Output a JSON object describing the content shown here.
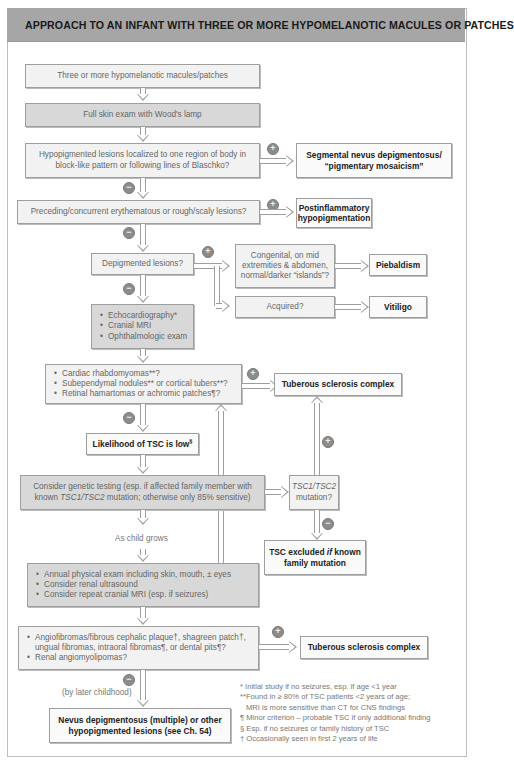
{
  "header": {
    "title": "APPROACH TO AN INFANT WITH THREE OR MORE HYPOMELANOTIC MACULES OR PATCHES"
  },
  "colors": {
    "header_bg": "#a6a6a6",
    "box_light": "#f2f2f2",
    "box_dark": "#d8d8d8",
    "border": "#9e9e9e",
    "sign_circle": "#8c8c8c"
  },
  "signs": {
    "positive": "+",
    "negative": "−"
  },
  "nodes": {
    "start": "Three or more hypomelanotic macules/patches",
    "woods_lamp": "Full skin exam with Wood's lamp",
    "segmental_q": "Hypopigmented lesions localized to one region of body in block-like pattern or following lines of Blaschko?",
    "segmental_result": "Segmental nevus depigmentosus/ “pigmentary mosaicism”",
    "postinflammatory_q": "Preceding/concurrent erythematous or rough/scaly lesions?",
    "postinflammatory_result": "Postinflammatory hypopigmentation",
    "depigmented_q": "Depigmented lesions?",
    "congenital_q": "Congenital, on mid extremities & abdomen, normal/darker “islands”?",
    "piebaldism": "Piebaldism",
    "acquired_q": "Acquired?",
    "vitiligo": "Vitiligo",
    "workup": [
      "Echocardiography*",
      "Cranial MRI",
      "Ophthalmologic exam"
    ],
    "tsc_findings_q": [
      "Cardiac rhabdomyomas**?",
      "Subependymal nodules** or cortical tubers**?",
      "Retinal hamartomas or achromic patches¶?"
    ],
    "tsc_result_1": "Tuberous sclerosis complex",
    "tsc_low": "Likelihood of TSC is low",
    "tsc_low_sup": "§",
    "genetic_testing_pre": "Consider genetic testing (esp. if affected family member with known ",
    "genetic_testing_gene": "TSC1/TSC2",
    "genetic_testing_post": " mutation; otherwise only 85% sensitive)",
    "mutation_q_gene": "TSC1/TSC2",
    "mutation_q_text": "mutation?",
    "tsc_excluded_pre": "TSC excluded ",
    "tsc_excluded_if": "if",
    "tsc_excluded_post": " known family mutation",
    "as_child_grows": "As child grows",
    "followup": [
      "Annual physical exam including skin, mouth, ± eyes",
      "Consider renal ultrasound",
      "Consider repeat cranial MRI (esp. if seizures)"
    ],
    "later_findings_q": [
      "Angiofibromas/fibrous cephalic plaque†, shagreen patch†, ungual fibromas, intraoral fibromas¶, or dental pits¶?",
      "Renal angiomyolipomas?"
    ],
    "tsc_result_2": "Tuberous sclerosis complex",
    "by_later_childhood": "(by later childhood)",
    "final_result": "Nevus depigmentosus (multiple) or other hypopigmented lesions (see Ch. 54)"
  },
  "footnotes": [
    "* Initial study if no seizures, esp. if age <1 year",
    "**Found in ≥ 80% of TSC patients <2 years of age;",
    "   MRI is more sensitive than CT for CNS findings",
    "¶ Minor criterion – probable TSC if only additional finding",
    "§ Esp. if no seizures or family history of TSC",
    "† Occasionally seen in first 2 years of life"
  ]
}
